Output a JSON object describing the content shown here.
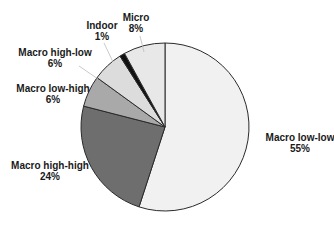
{
  "chart_data": {
    "type": "pie",
    "title": "",
    "start_angle_deg": 0,
    "direction": "clockwise",
    "slices": [
      {
        "label": "Macro low-low",
        "value": 55,
        "value_label": "55%",
        "color": "#f1f1f1"
      },
      {
        "label": "Macro high-high",
        "value": 24,
        "value_label": "24%",
        "color": "#6e6e6e"
      },
      {
        "label": "Macro low-high",
        "value": 6,
        "value_label": "6%",
        "color": "#a9a9a9"
      },
      {
        "label": "Macro high-low",
        "value": 6,
        "value_label": "6%",
        "color": "#dcdcdc"
      },
      {
        "label": "Indoor",
        "value": 1,
        "value_label": "1%",
        "color": "#111111"
      },
      {
        "label": "Micro",
        "value": 8,
        "value_label": "8%",
        "color": "#e8e8e8"
      }
    ],
    "categories": [
      "Macro low-low",
      "Macro high-high",
      "Macro low-high",
      "Macro high-low",
      "Indoor",
      "Micro"
    ],
    "values": [
      55,
      24,
      6,
      6,
      1,
      8
    ],
    "legend": "none (direct labels)"
  },
  "labels": [
    {
      "name": "Macro low-low",
      "pct": "55%",
      "x": 300,
      "y": 133
    },
    {
      "name": "Macro high-high",
      "pct": "24%",
      "x": 50,
      "y": 162
    },
    {
      "name": "Macro low-high",
      "pct": "6%",
      "x": 55,
      "y": 84
    },
    {
      "name": "Macro high-low",
      "pct": "6%",
      "x": 55,
      "y": 48
    },
    {
      "name": "Indoor",
      "pct": "1%",
      "x": 102,
      "y": 21
    },
    {
      "name": "Micro",
      "pct": "8%",
      "x": 136,
      "y": 14
    }
  ]
}
